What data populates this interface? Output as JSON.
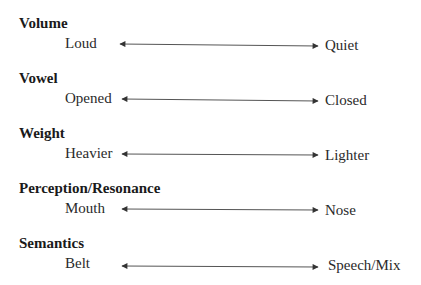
{
  "rows": [
    {
      "heading": "Volume",
      "left": "Loud",
      "right": "Quiet"
    },
    {
      "heading": "Vowel",
      "left": "Opened",
      "right": "Closed"
    },
    {
      "heading": "Weight",
      "left": "Heavier",
      "right": "Lighter"
    },
    {
      "heading": "Perception/Resonance",
      "left": "Mouth",
      "right": "Nose"
    },
    {
      "heading": "Semantics",
      "left": "Belt",
      "right": "Speech/Mix"
    }
  ],
  "colors": {
    "text": "#1a1a1a",
    "arrow": "#333333"
  }
}
